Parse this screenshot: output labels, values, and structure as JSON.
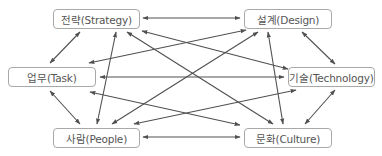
{
  "diagram": {
    "type": "network",
    "nodes": [
      {
        "id": "strategy",
        "label": "전략(Strategy)",
        "x": 53,
        "y": 9,
        "w": 87,
        "h": 20
      },
      {
        "id": "design",
        "label": "설계(Design)",
        "x": 244,
        "y": 9,
        "w": 88,
        "h": 20
      },
      {
        "id": "task",
        "label": "업무(Task)",
        "x": 8,
        "y": 67,
        "w": 88,
        "h": 20
      },
      {
        "id": "technology",
        "label": "기술(Technology)",
        "x": 288,
        "y": 67,
        "w": 87,
        "h": 20
      },
      {
        "id": "people",
        "label": "사람(People)",
        "x": 53,
        "y": 128,
        "w": 87,
        "h": 20
      },
      {
        "id": "culture",
        "label": "문화(Culture)",
        "x": 244,
        "y": 128,
        "w": 88,
        "h": 20
      }
    ],
    "edges": [
      {
        "from": "strategy",
        "to": "design",
        "direction": "both",
        "x1": 143,
        "y1": 18,
        "x2": 240,
        "y2": 18
      },
      {
        "from": "strategy",
        "to": "task",
        "direction": "both",
        "x1": 80,
        "y1": 32,
        "x2": 50,
        "y2": 63
      },
      {
        "from": "strategy",
        "to": "people",
        "direction": "both",
        "x1": 116,
        "y1": 32,
        "x2": 97,
        "y2": 124
      },
      {
        "from": "strategy",
        "to": "culture",
        "direction": "both",
        "x1": 127,
        "y1": 32,
        "x2": 273,
        "y2": 124
      },
      {
        "from": "strategy",
        "to": "technology",
        "direction": "both",
        "x1": 142,
        "y1": 31,
        "x2": 288,
        "y2": 69
      },
      {
        "from": "design",
        "to": "task",
        "direction": "both",
        "x1": 246,
        "y1": 30,
        "x2": 89,
        "y2": 63
      },
      {
        "from": "design",
        "to": "people",
        "direction": "both",
        "x1": 258,
        "y1": 32,
        "x2": 112,
        "y2": 124
      },
      {
        "from": "design",
        "to": "culture",
        "direction": "both",
        "x1": 268,
        "y1": 32,
        "x2": 283,
        "y2": 124
      },
      {
        "from": "design",
        "to": "technology",
        "direction": "both",
        "x1": 302,
        "y1": 32,
        "x2": 335,
        "y2": 64
      },
      {
        "from": "task",
        "to": "technology",
        "direction": "both",
        "x1": 100,
        "y1": 77,
        "x2": 284,
        "y2": 77
      },
      {
        "from": "task",
        "to": "people",
        "direction": "both",
        "x1": 50,
        "y1": 91,
        "x2": 80,
        "y2": 124
      },
      {
        "from": "task",
        "to": "culture",
        "direction": "both",
        "x1": 90,
        "y1": 92,
        "x2": 240,
        "y2": 125
      },
      {
        "from": "technology",
        "to": "people",
        "direction": "both",
        "x1": 296,
        "y1": 90,
        "x2": 134,
        "y2": 124
      },
      {
        "from": "technology",
        "to": "culture",
        "direction": "both",
        "x1": 335,
        "y1": 90,
        "x2": 305,
        "y2": 124
      },
      {
        "from": "people",
        "to": "culture",
        "direction": "both",
        "x1": 143,
        "y1": 137,
        "x2": 240,
        "y2": 137
      }
    ],
    "colors": {
      "line": "#505050",
      "node_border": "#a8a8a8",
      "node_text": "#555555",
      "background": "#ffffff"
    }
  }
}
